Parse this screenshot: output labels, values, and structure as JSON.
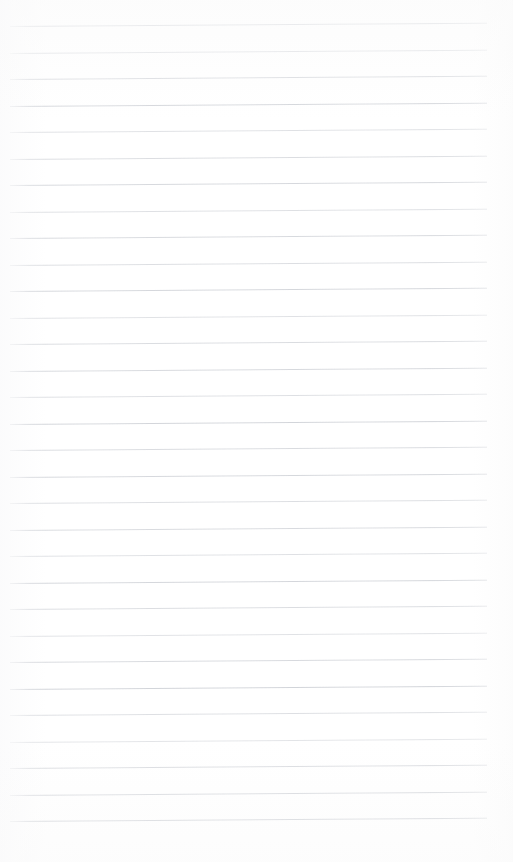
{
  "document": {
    "kind": "ruled-notebook-paper-scan",
    "title": "Blank ruled paper",
    "has_text_content": false,
    "page_width": 513,
    "page_height": 862,
    "background_color": "#ffffff",
    "rule_color": "#c9ccd2"
  },
  "ruling": {
    "line_count": 31,
    "first_line_y": 26,
    "line_spacing": 26.5,
    "line_start_x": 10,
    "line_end_x": 487,
    "line_thickness": 1,
    "slant_degrees": -0.4,
    "top_margin": 26,
    "bottom_margin": 42,
    "left_margin": 10,
    "right_margin": 26,
    "lines": [
      {
        "index": 1,
        "y": 26.0,
        "opacity": 0.62
      },
      {
        "index": 2,
        "y": 52.5,
        "opacity": 0.55
      },
      {
        "index": 3,
        "y": 79.0,
        "opacity": 0.7
      },
      {
        "index": 4,
        "y": 105.5,
        "opacity": 0.8
      },
      {
        "index": 5,
        "y": 132.0,
        "opacity": 0.58
      },
      {
        "index": 6,
        "y": 158.5,
        "opacity": 0.66
      },
      {
        "index": 7,
        "y": 185.0,
        "opacity": 0.75
      },
      {
        "index": 8,
        "y": 211.5,
        "opacity": 0.6
      },
      {
        "index": 9,
        "y": 238.0,
        "opacity": 0.72
      },
      {
        "index": 10,
        "y": 264.5,
        "opacity": 0.64
      },
      {
        "index": 11,
        "y": 291.0,
        "opacity": 0.78
      },
      {
        "index": 12,
        "y": 317.5,
        "opacity": 0.57
      },
      {
        "index": 13,
        "y": 344.0,
        "opacity": 0.68
      },
      {
        "index": 14,
        "y": 370.5,
        "opacity": 0.74
      },
      {
        "index": 15,
        "y": 397.0,
        "opacity": 0.61
      },
      {
        "index": 16,
        "y": 423.5,
        "opacity": 0.82
      },
      {
        "index": 17,
        "y": 450.0,
        "opacity": 0.69
      },
      {
        "index": 18,
        "y": 476.5,
        "opacity": 0.76
      },
      {
        "index": 19,
        "y": 503.0,
        "opacity": 0.63
      },
      {
        "index": 20,
        "y": 529.5,
        "opacity": 0.71
      },
      {
        "index": 21,
        "y": 556.0,
        "opacity": 0.59
      },
      {
        "index": 22,
        "y": 582.5,
        "opacity": 0.79
      },
      {
        "index": 23,
        "y": 609.0,
        "opacity": 0.66
      },
      {
        "index": 24,
        "y": 635.5,
        "opacity": 0.56
      },
      {
        "index": 25,
        "y": 662.0,
        "opacity": 0.73
      },
      {
        "index": 26,
        "y": 688.5,
        "opacity": 0.84
      },
      {
        "index": 27,
        "y": 715.0,
        "opacity": 0.62
      },
      {
        "index": 28,
        "y": 741.5,
        "opacity": 0.52
      },
      {
        "index": 29,
        "y": 768.0,
        "opacity": 0.7
      },
      {
        "index": 30,
        "y": 794.5,
        "opacity": 0.77
      },
      {
        "index": 31,
        "y": 821.0,
        "opacity": 0.86
      }
    ]
  }
}
